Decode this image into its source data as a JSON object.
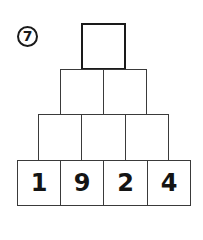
{
  "problem": {
    "number": "7",
    "icon": "circled-number"
  },
  "pyramid": {
    "rows": [
      {
        "cells": [
          ""
        ]
      },
      {
        "cells": [
          "",
          ""
        ]
      },
      {
        "cells": [
          "",
          "",
          ""
        ]
      },
      {
        "cells": [
          "1",
          "9",
          "2",
          "4"
        ]
      }
    ]
  }
}
